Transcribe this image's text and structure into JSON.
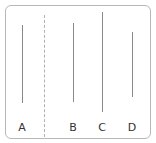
{
  "diagram": {
    "lines": [
      {
        "label": "A",
        "x": 22,
        "y1": 25,
        "y2": 103
      },
      {
        "label": "B",
        "x": 73,
        "y1": 23,
        "y2": 102
      },
      {
        "label": "C",
        "x": 102,
        "y1": 12,
        "y2": 112
      },
      {
        "label": "D",
        "x": 132,
        "y1": 32,
        "y2": 97
      }
    ],
    "separator": {
      "x": 44,
      "y1": 15,
      "y2": 137,
      "style": "dashed"
    },
    "labels": {
      "a": "A",
      "b": "B",
      "c": "C",
      "d": "D"
    },
    "colors": {
      "line": "#8a8a8a",
      "frame": "#b8b8b8",
      "separator": "#b0b0b0",
      "text": "#333333"
    }
  }
}
